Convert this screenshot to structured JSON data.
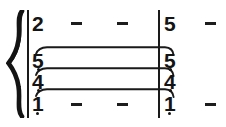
{
  "notation": {
    "system": "jianpu-numbered-notation",
    "brace": "curly-brace",
    "barlines": [
      {
        "name": "system-start-barline",
        "x": 27,
        "y": 10,
        "height": 108,
        "width": 2
      },
      {
        "name": "measure-barline",
        "x": 158,
        "y": 10,
        "height": 108,
        "width": 2
      }
    ],
    "measures": [
      {
        "index": 1,
        "voices": [
          {
            "name": "top-voice",
            "notes": [
              {
                "digit": "2",
                "x": 32,
                "y": 13,
                "octave_dot": false
              },
              {
                "dash": true,
                "x": 71,
                "y": 22
              },
              {
                "dash": true,
                "x": 117,
                "y": 22
              }
            ]
          },
          {
            "name": "upper-chord-voice",
            "notes": [
              {
                "digit": "5",
                "x": 32,
                "y": 50,
                "octave_dot": true
              }
            ]
          },
          {
            "name": "middle-chord-voice",
            "notes": [
              {
                "digit": "4",
                "x": 32,
                "y": 71,
                "octave_dot": true
              }
            ]
          },
          {
            "name": "bottom-voice",
            "notes": [
              {
                "digit": "1",
                "x": 32,
                "y": 93,
                "octave_dot": true
              },
              {
                "dash": true,
                "x": 71,
                "y": 103
              },
              {
                "dash": true,
                "x": 117,
                "y": 103
              }
            ]
          }
        ]
      },
      {
        "index": 2,
        "voices": [
          {
            "name": "top-voice",
            "notes": [
              {
                "digit": "5",
                "x": 164,
                "y": 13,
                "octave_dot": false
              },
              {
                "dash": true,
                "x": 205,
                "y": 22
              }
            ]
          },
          {
            "name": "upper-chord-voice",
            "notes": [
              {
                "digit": "5",
                "x": 164,
                "y": 50,
                "octave_dot": true
              }
            ]
          },
          {
            "name": "middle-chord-voice",
            "notes": [
              {
                "digit": "4",
                "x": 164,
                "y": 71,
                "octave_dot": true
              }
            ]
          },
          {
            "name": "bottom-voice",
            "notes": [
              {
                "digit": "1",
                "x": 164,
                "y": 93,
                "octave_dot": true
              },
              {
                "dash": true,
                "x": 205,
                "y": 103
              }
            ]
          }
        ]
      }
    ],
    "ties": [
      {
        "name": "tie-upper",
        "x1": 36,
        "y": 48,
        "x2": 170,
        "label": "tie-5-to-5"
      },
      {
        "name": "tie-middle",
        "x1": 36,
        "y": 69,
        "x2": 170,
        "label": "tie-4-to-4"
      },
      {
        "name": "tie-lower",
        "x1": 36,
        "y": 90,
        "x2": 170,
        "label": "tie-1-to-1"
      }
    ],
    "colors": {
      "ink": "#141414",
      "line": "#1a1a1a",
      "paper": "#ffffff"
    },
    "labels": {
      "top_voice_m1": "2",
      "top_voice_m2": "5",
      "chord_upper": "5",
      "chord_middle": "4",
      "chord_bottom": "1",
      "dash_glyph": "–"
    }
  }
}
